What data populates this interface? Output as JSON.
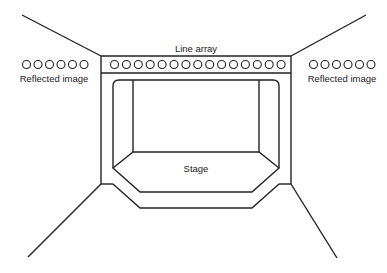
{
  "diagram": {
    "type": "venue-floorplan",
    "colors": {
      "stroke": "#222222",
      "background": "#ffffff"
    },
    "labels": {
      "line_array": "Line array",
      "stage": "Stage",
      "reflected_left": "Reflected image",
      "reflected_right": "Reflected image"
    },
    "line_array": {
      "speaker_count": 15
    },
    "reflected_left": {
      "speaker_count": 6
    },
    "reflected_right": {
      "speaker_count": 6
    }
  }
}
